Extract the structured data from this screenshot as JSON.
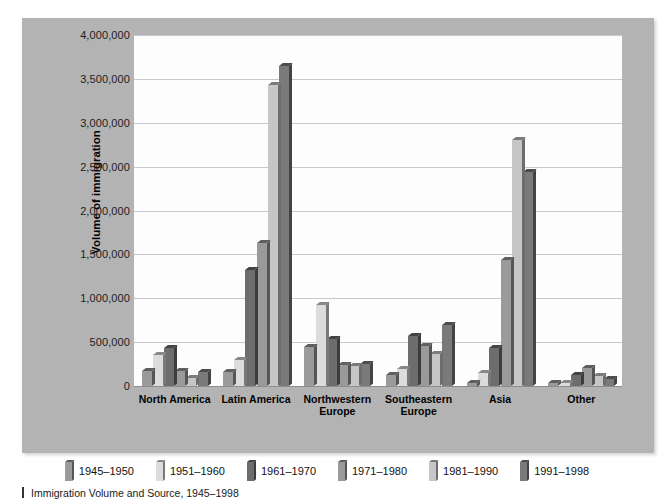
{
  "chart_data": {
    "type": "bar",
    "title": "",
    "xlabel": "",
    "ylabel": "Volume of immigration",
    "ylim": [
      0,
      4000000
    ],
    "ytick_values": [
      0,
      500000,
      1000000,
      1500000,
      2000000,
      2500000,
      3000000,
      3500000,
      4000000
    ],
    "ytick_labels": [
      "0",
      "500,000",
      "1,000,000",
      "1,500,000",
      "2,000,000",
      "2,500,000",
      "3,000,000",
      "3,500,000",
      "4,000,000"
    ],
    "grid": true,
    "legend_position": "bottom",
    "categories": [
      "North America",
      "Latin America",
      "Northwestern\nEurope",
      "Southeastern\nEurope",
      "Asia",
      "Other"
    ],
    "series": [
      {
        "name": "1945–1950",
        "color": "#9a9a9a",
        "values": [
          170000,
          160000,
          450000,
          120000,
          40000,
          30000
        ]
      },
      {
        "name": "1951–1960",
        "color": "#dcdcdc",
        "values": [
          350000,
          300000,
          920000,
          190000,
          150000,
          40000
        ]
      },
      {
        "name": "1961–1970",
        "color": "#6d6d6d",
        "values": [
          430000,
          1320000,
          540000,
          570000,
          430000,
          130000
        ]
      },
      {
        "name": "1971–1980",
        "color": "#9a9a9a",
        "values": [
          170000,
          1630000,
          240000,
          460000,
          1440000,
          200000
        ]
      },
      {
        "name": "1981–1990",
        "color": "#c6c6c6",
        "values": [
          90000,
          3430000,
          230000,
          360000,
          2800000,
          110000
        ]
      },
      {
        "name": "1991–1998",
        "color": "#7a7a7a",
        "values": [
          160000,
          3650000,
          250000,
          700000,
          2440000,
          80000
        ]
      }
    ]
  },
  "legend": {
    "items": [
      {
        "label": "1945–1950"
      },
      {
        "label": "1951–1960"
      },
      {
        "label": "1961–1970"
      },
      {
        "label": "1971–1980"
      },
      {
        "label": "1981–1990"
      },
      {
        "label": "1991–1998"
      }
    ]
  },
  "caption": {
    "marker": "",
    "text": "Immigration Volume and Source, 1945–1998"
  },
  "colors": {
    "frame": "#b4b4b4",
    "plot_background": "#ffffff",
    "gridline": "#c9c9c9",
    "axis": "#8d8d8d",
    "text": "#111111"
  }
}
